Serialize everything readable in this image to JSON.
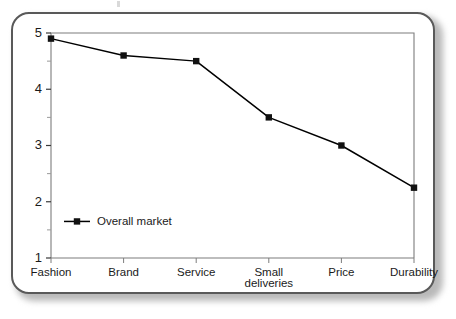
{
  "card": {
    "border_color": "#595959",
    "background": "#ffffff"
  },
  "chart_data": {
    "type": "line",
    "title": "",
    "subtitle": "",
    "xlabel": "",
    "ylabel": "",
    "categories": [
      "Fashion",
      "Brand",
      "Service",
      "Small deliveries",
      "Price",
      "Durability"
    ],
    "category_lines": [
      [
        "Fashion"
      ],
      [
        "Brand"
      ],
      [
        "Service"
      ],
      [
        "Small",
        "deliveries"
      ],
      [
        "Price"
      ],
      [
        "Durability"
      ]
    ],
    "series": [
      {
        "name": "Overall market",
        "values": [
          4.9,
          4.6,
          4.5,
          3.5,
          3.0,
          2.25
        ],
        "color": "#000000",
        "marker": "square"
      }
    ],
    "ylim": [
      1,
      5
    ],
    "y_ticks_major": [
      1,
      2,
      3,
      4,
      5
    ],
    "y_tick_labels": [
      "1",
      "2",
      "3",
      "4",
      "5"
    ],
    "y_ticks_minor": [
      1.5,
      2.5,
      3.5,
      4.5
    ],
    "grid": false,
    "legend": {
      "position": "inside-bottom-left",
      "entries": [
        "Overall market"
      ]
    }
  }
}
